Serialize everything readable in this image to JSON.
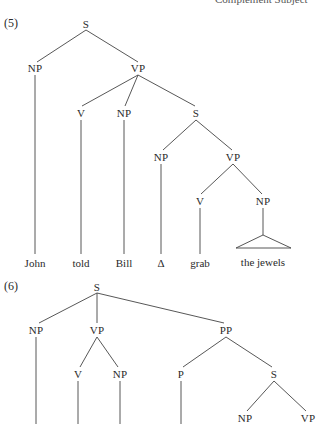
{
  "running_head": "Complement Subject",
  "trees": [
    {
      "label": "(5)",
      "nodes": {
        "root": "S",
        "np_subject": "NP",
        "vp": "VP",
        "v": "V",
        "np_object": "NP",
        "s_embedded": "S",
        "np_embedded": "NP",
        "vp_embedded": "VP",
        "v_embedded": "V",
        "np_embedded_object": "NP"
      },
      "leaves": [
        "John",
        "told",
        "Bill",
        "Δ",
        "grab",
        "the jewels"
      ]
    },
    {
      "label": "(6)",
      "nodes": {
        "root": "S",
        "np_subject": "NP",
        "vp": "VP",
        "pp": "PP",
        "v": "V",
        "np_object": "NP",
        "p": "P",
        "s_embedded": "S",
        "np_embedded": "NP",
        "vp_embedded": "VP"
      }
    }
  ]
}
